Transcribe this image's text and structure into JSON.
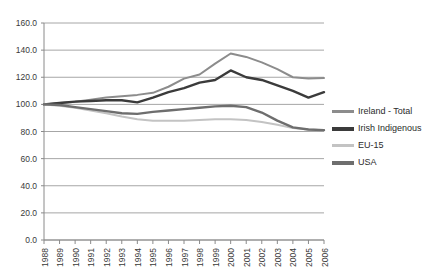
{
  "chart_data": {
    "type": "line",
    "title": "",
    "xlabel": "",
    "ylabel": "",
    "ylim": [
      0.0,
      160.0
    ],
    "ytick_step": 20.0,
    "ytick_labels": [
      "0.0",
      "20.0",
      "40.0",
      "60.0",
      "80.0",
      "100.0",
      "120.0",
      "140.0",
      "160.0"
    ],
    "grid": true,
    "legend_position": "right",
    "categories": [
      "1988",
      "1989",
      "1990",
      "1991",
      "1992",
      "1993",
      "1994",
      "1995",
      "1996",
      "1997",
      "1998",
      "1999",
      "2000",
      "2001",
      "2002",
      "2003",
      "2004",
      "2005",
      "2006"
    ],
    "series": [
      {
        "name": "Ireland - Total",
        "color": "#8c8c8c",
        "width": 2.0,
        "values": [
          100,
          101,
          102,
          103.5,
          105,
          106,
          107,
          108.5,
          113,
          119,
          122,
          130,
          137.5,
          135,
          131,
          126,
          120,
          119,
          119.5
        ]
      },
      {
        "name": "Irish Indigenous",
        "color": "#3b3b3b",
        "width": 2.4,
        "values": [
          100,
          101,
          102,
          102.5,
          103,
          103,
          101.5,
          105,
          109,
          112,
          116,
          118,
          125,
          120,
          118,
          114,
          110,
          105,
          109
        ]
      },
      {
        "name": "EU-15",
        "color": "#c3c3c3",
        "width": 2.0,
        "values": [
          100,
          99,
          97.5,
          95.5,
          93.5,
          91,
          89,
          88,
          88,
          88,
          88.5,
          89,
          89,
          88.5,
          87,
          85,
          82.5,
          81.5,
          81
        ]
      },
      {
        "name": "USA",
        "color": "#6e6e6e",
        "width": 2.4,
        "values": [
          100,
          99.5,
          98,
          96.5,
          95,
          93.5,
          93,
          94.5,
          95.5,
          96.5,
          97.5,
          98.5,
          99,
          98,
          94,
          88,
          83,
          81.5,
          81
        ]
      }
    ]
  },
  "legend": {
    "items": [
      {
        "label": "Ireland - Total"
      },
      {
        "label": "Irish Indigenous"
      },
      {
        "label": "EU-15"
      },
      {
        "label": "USA"
      }
    ]
  }
}
